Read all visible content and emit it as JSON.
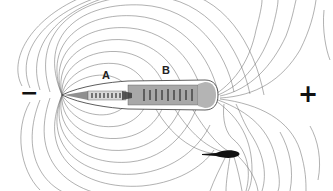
{
  "diagram": {
    "labels": {
      "a": "A",
      "b": "B",
      "negative_pole": "−",
      "positive_pole": "+"
    },
    "colors": {
      "field_line": "#6a6a6a",
      "body_outline": "#333333",
      "body_fill_front": "#d8d8d8",
      "body_fill_rear": "#a8a8a8",
      "electrocyte": "#222222",
      "object_fill": "#111111",
      "background": "#ffffff"
    }
  }
}
